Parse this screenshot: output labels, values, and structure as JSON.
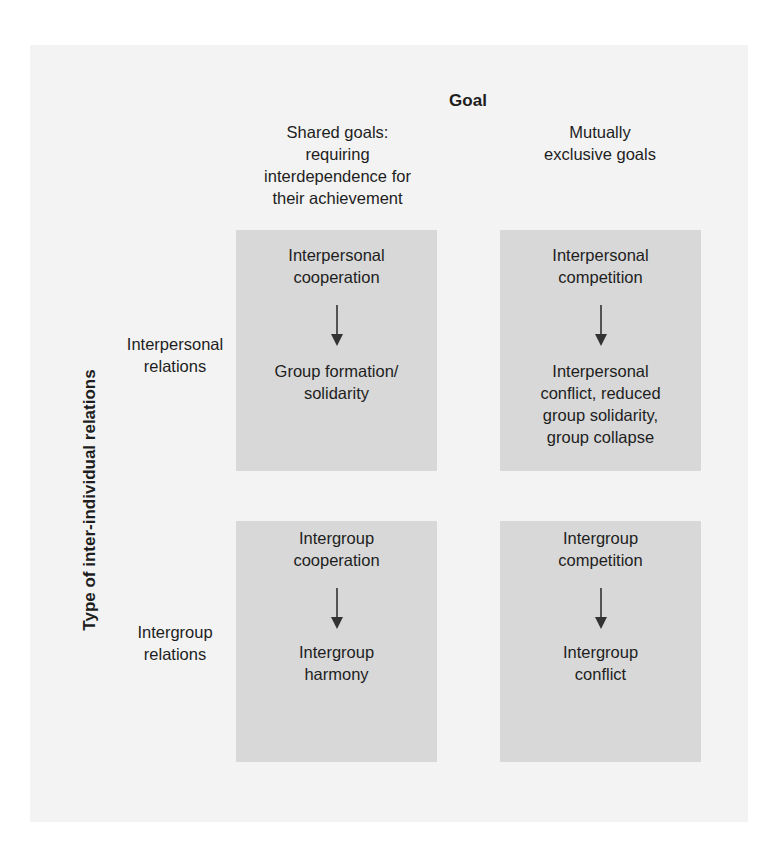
{
  "diagram": {
    "goal_title": "Goal",
    "columns": [
      {
        "label": "Shared goals:\nrequiring\ninterdependence for\ntheir achievement"
      },
      {
        "label": "Mutually\nexclusive goals"
      }
    ],
    "axis_title": "Type of inter-individual relations",
    "rows": [
      {
        "label": "Interpersonal\nrelations"
      },
      {
        "label": "Intergroup\nrelations"
      }
    ],
    "cells": [
      [
        {
          "cause": "Interpersonal\ncooperation",
          "effect": "Group formation/\nsolidarity"
        },
        {
          "cause": "Interpersonal\ncompetition",
          "effect": "Interpersonal\nconflict, reduced\ngroup solidarity,\ngroup collapse"
        }
      ],
      [
        {
          "cause": "Intergroup\ncooperation",
          "effect": "Intergroup\nharmony"
        },
        {
          "cause": "Intergroup\ncompetition",
          "effect": "Intergroup\nconflict"
        }
      ]
    ],
    "colors": {
      "page_background": "#f3f3f3",
      "cell_fill": "#d8d8d8",
      "text": "#1e1e1e",
      "arrow": "#333333"
    }
  }
}
